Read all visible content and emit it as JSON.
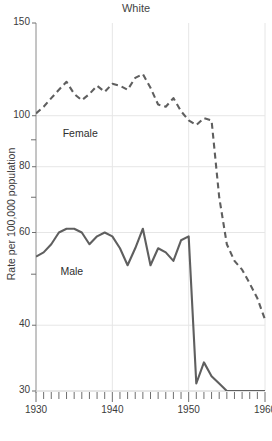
{
  "chart_data": {
    "type": "line",
    "title": "White",
    "xlabel": "",
    "ylabel": "Rate per 100,000 population",
    "xlim": [
      1930,
      1960
    ],
    "ylim": [
      30,
      150
    ],
    "yscale": "log",
    "grid": true,
    "legend_position": "inline-annotations",
    "y_major_ticks": [
      150,
      100,
      80,
      60,
      40,
      30
    ],
    "y_minor_ticks": [
      90,
      70,
      50
    ],
    "x_major_ticks": [
      1930,
      1940,
      1950,
      1960
    ],
    "x_minor_tick_interval": 1,
    "x_tick_labels": [
      "1930",
      "1940",
      "1950",
      "1960"
    ],
    "y_tick_labels": [
      "150",
      "100",
      "80",
      "60",
      "40",
      "30"
    ],
    "annotations": [
      {
        "text": "Female",
        "x": 1933.5,
        "y": 92.5
      },
      {
        "text": "Male",
        "x": 1933.2,
        "y": 50.5
      }
    ],
    "series": [
      {
        "name": "Female",
        "style": "dashed",
        "color": "#5f5f5f",
        "x": [
          1930,
          1931,
          1932,
          1933,
          1934,
          1935,
          1936,
          1937,
          1938,
          1939,
          1940,
          1941,
          1942,
          1943,
          1944,
          1945,
          1946,
          1947,
          1948,
          1949,
          1950,
          1951,
          1952,
          1953,
          1954,
          1955,
          1956,
          1957,
          1958,
          1959,
          1960
        ],
        "values": [
          101,
          104,
          108,
          112,
          116,
          110,
          107,
          110,
          114,
          111,
          115,
          114,
          112,
          118,
          120,
          113,
          105,
          104,
          108,
          102,
          98,
          96,
          99,
          98,
          70,
          57,
          53,
          51,
          48,
          45,
          41
        ]
      },
      {
        "name": "Male",
        "style": "solid",
        "color": "#5f5f5f",
        "x": [
          1930,
          1931,
          1932,
          1933,
          1934,
          1935,
          1936,
          1937,
          1938,
          1939,
          1940,
          1941,
          1942,
          1943,
          1944,
          1945,
          1946,
          1947,
          1948,
          1949,
          1950,
          1951,
          1952,
          1953,
          1954,
          1955,
          1956,
          1957,
          1958,
          1959,
          1960
        ],
        "values": [
          54,
          55,
          57,
          60,
          61,
          61,
          60,
          57,
          59,
          60,
          59,
          56,
          52,
          56,
          61,
          52,
          56,
          55,
          53,
          58,
          59,
          31,
          34,
          32,
          31,
          30,
          30,
          30,
          30,
          30,
          30
        ]
      }
    ]
  }
}
